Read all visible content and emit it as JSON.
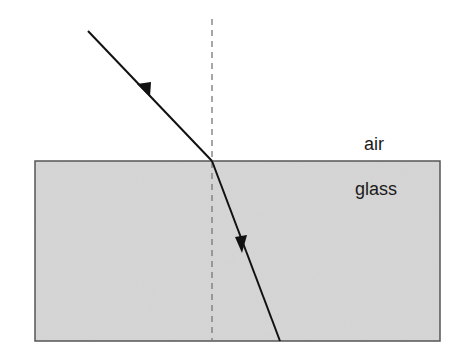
{
  "diagram": {
    "type": "refraction",
    "labels": {
      "upper_medium": "air",
      "lower_medium": "glass"
    },
    "colors": {
      "glass_fill": "#d6d6d6",
      "glass_border": "#555555",
      "ray": "#111111",
      "normal": "#777777",
      "background": "#ffffff"
    },
    "geometry": {
      "glass_block": {
        "x": 35,
        "y": 161,
        "width": 405,
        "height": 180
      },
      "normal_line": {
        "x": 212,
        "y1": 19,
        "y2": 341
      },
      "incident_ray": {
        "x1": 88,
        "y1": 31,
        "x2": 212,
        "y2": 161
      },
      "refracted_ray": {
        "x1": 212,
        "y1": 161,
        "x2": 280,
        "y2": 341
      }
    }
  }
}
